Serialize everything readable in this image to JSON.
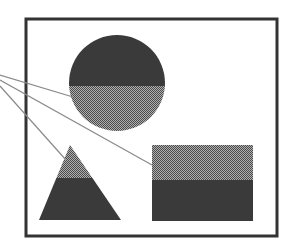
{
  "figure": {
    "frame": {
      "x": 26,
      "y": 19,
      "width": 251,
      "height": 217,
      "stroke": "#333333",
      "stroke_width": 3
    },
    "colors": {
      "dark_fill": "#3a3a3a",
      "checker_a": "#4a4a4a",
      "checker_b": "#b0b0b0",
      "leader_line": "#8a8a8a",
      "background": "#ffffff"
    },
    "shapes": {
      "circle": {
        "cx": 117,
        "cy": 83,
        "r": 48,
        "split_y": 86,
        "top": "dark",
        "bottom": "checkered"
      },
      "triangle": {
        "apex": [
          70,
          145
        ],
        "base_left": [
          39,
          220
        ],
        "base_right": [
          121,
          220
        ],
        "split_y": 178,
        "top": "checkered",
        "bottom": "dark"
      },
      "rectangle": {
        "x": 152,
        "y": 145,
        "width": 101,
        "height": 76,
        "split_y": 180,
        "top": "checkered",
        "bottom": "dark"
      }
    },
    "leader_lines": [
      {
        "target": "circle",
        "from": [
          0,
          75
        ],
        "to": [
          73,
          97
        ]
      },
      {
        "target": "rectangle",
        "from": [
          0,
          80
        ],
        "to": [
          152,
          165
        ]
      },
      {
        "target": "triangle",
        "from": [
          0,
          86
        ],
        "to": [
          66,
          160
        ]
      }
    ]
  }
}
